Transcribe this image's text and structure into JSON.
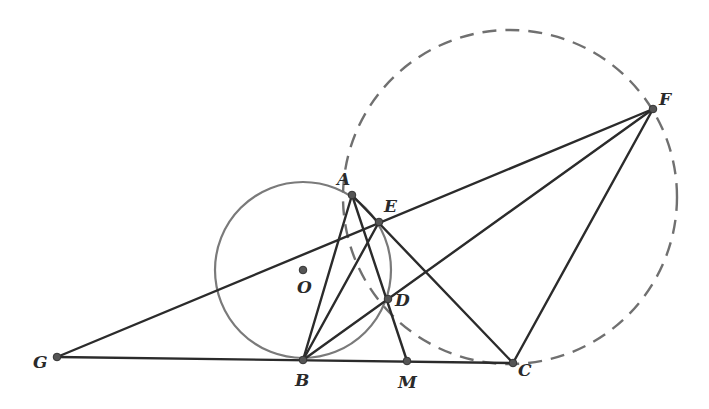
{
  "figure": {
    "colors": {
      "line": "#2b2b2b",
      "circle": "#7a7a7a",
      "dashed": "#707070",
      "point": "#555555"
    },
    "points": {
      "A": {
        "label": "A",
        "x": 352,
        "y": 195,
        "lx": 337,
        "ly": 185
      },
      "B": {
        "label": "B",
        "x": 303,
        "y": 360,
        "lx": 295,
        "ly": 386
      },
      "C": {
        "label": "C",
        "x": 513,
        "y": 363,
        "lx": 518,
        "ly": 376
      },
      "D": {
        "label": "D",
        "x": 388,
        "y": 299,
        "lx": 395,
        "ly": 306
      },
      "E": {
        "label": "E",
        "x": 379,
        "y": 222,
        "lx": 384,
        "ly": 212
      },
      "F": {
        "label": "F",
        "x": 653,
        "y": 109,
        "lx": 659,
        "ly": 105
      },
      "G": {
        "label": "G",
        "x": 57,
        "y": 357,
        "lx": 33,
        "ly": 368
      },
      "M": {
        "label": "M",
        "x": 407,
        "y": 361,
        "lx": 398,
        "ly": 388
      },
      "O": {
        "label": "O",
        "x": 303,
        "y": 270,
        "lx": 297,
        "ly": 293
      }
    },
    "circle_O": {
      "cx": 303,
      "cy": 270,
      "r": 88,
      "style": "solid"
    },
    "circle_dashed": {
      "cx": 510,
      "cy": 197,
      "r": 167,
      "style": "dashed"
    },
    "segments": [
      [
        "G",
        "C"
      ],
      [
        "G",
        "F"
      ],
      [
        "A",
        "B"
      ],
      [
        "A",
        "M"
      ],
      [
        "A",
        "C"
      ],
      [
        "B",
        "E"
      ],
      [
        "B",
        "F"
      ],
      [
        "F",
        "C"
      ]
    ]
  }
}
